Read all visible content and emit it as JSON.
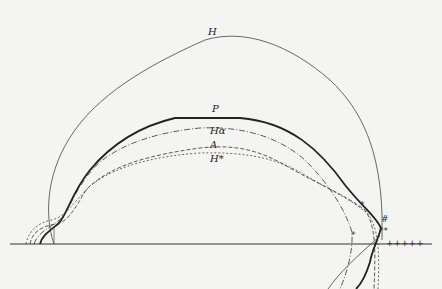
{
  "figure": {
    "type": "curve-diagram",
    "baseline": "horizontal axis line",
    "curves": [
      {
        "id": "H",
        "label": "H",
        "style": "thin solid"
      },
      {
        "id": "P",
        "label": "P",
        "style": "thick solid"
      },
      {
        "id": "Ha",
        "label": "Hα",
        "style": "dash-dot"
      },
      {
        "id": "A",
        "label": "A",
        "style": "dashed"
      },
      {
        "id": "Hs",
        "label": "H*",
        "style": "short dashed"
      }
    ],
    "markers": {
      "star1": "*",
      "star2": "*",
      "star3": "**",
      "hash": "#",
      "plus_row": "+++++"
    }
  }
}
